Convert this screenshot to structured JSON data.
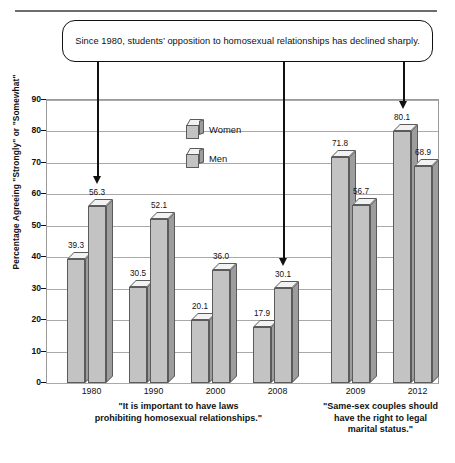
{
  "callout": {
    "text": "Since 1980, students’ opposition to homosexual relationships has declined sharply."
  },
  "chart_data": {
    "type": "bar",
    "title": "",
    "xlabel": "",
    "ylabel": "Percentage Agreeing \"Strongly\" or \"Somewhat\"",
    "ylim": [
      0,
      90
    ],
    "ytick_step": 10,
    "yticks": [
      "0",
      "10",
      "20",
      "30",
      "40",
      "50",
      "60",
      "70",
      "80",
      "90"
    ],
    "grid": true,
    "legend_position": "inside-upper-center",
    "categories": [
      "1980",
      "1990",
      "2000",
      "2008",
      "2009",
      "2012"
    ],
    "series": [
      {
        "name": "Women",
        "values": [
          39.3,
          30.5,
          20.1,
          17.9,
          71.8,
          80.1
        ]
      },
      {
        "name": "Men",
        "values": [
          56.3,
          52.1,
          36.0,
          30.1,
          56.7,
          68.9
        ]
      }
    ],
    "value_labels": {
      "1980": {
        "Women": "39.3",
        "Men": "56.3"
      },
      "1990": {
        "Women": "30.5",
        "Men": "52.1"
      },
      "2000": {
        "Women": "20.1",
        "Men": "36.0"
      },
      "2008": {
        "Women": "17.9",
        "Men": "30.1"
      },
      "2009": {
        "Women": "71.8",
        "Men": "56.7"
      },
      "2012": {
        "Women": "80.1",
        "Men": "68.9"
      }
    },
    "groups": [
      {
        "caption_lines": [
          "\"It is important to have laws",
          "prohibiting homosexual relationships.\""
        ],
        "categories": [
          "1980",
          "1990",
          "2000",
          "2008"
        ]
      },
      {
        "caption_lines": [
          "\"Same-sex couples should",
          "have the right to legal",
          "marital status.\""
        ],
        "categories": [
          "2009",
          "2012"
        ]
      }
    ],
    "annotations": [
      {
        "target": "1980",
        "kind": "arrow-down"
      },
      {
        "target": "2008",
        "kind": "arrow-down"
      },
      {
        "target": "2012",
        "kind": "arrow-down"
      }
    ],
    "colors": {
      "bar_front": "#c3c3c3",
      "bar_side": "#9d9d9d",
      "bar_top": "#f2f2f2",
      "bar_outline": "#5b5b5b",
      "gridline": "#a9a9a9",
      "text": "#111111"
    }
  },
  "legend": {
    "items": [
      {
        "label": "Women"
      },
      {
        "label": "Men"
      }
    ]
  }
}
